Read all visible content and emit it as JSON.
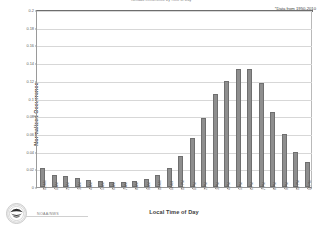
{
  "chart_data": {
    "type": "bar",
    "title": "Tornado Occurrence by Time of Day",
    "subtitle": "",
    "xlabel": "Local Time of Day",
    "ylabel": "Normalized Occurrence",
    "ylim": [
      0,
      0.2
    ],
    "ytick_labels": [
      "0.2",
      "0.18",
      "0.16",
      "0.14",
      "0.12",
      "0.1",
      "0.08",
      "0.06",
      "0.04",
      "0.02",
      "0"
    ],
    "ytick_values": [
      0.2,
      0.18,
      0.16,
      0.14,
      0.12,
      0.1,
      0.08,
      0.06,
      0.04,
      0.02,
      0
    ],
    "grid": true,
    "legend": "none",
    "annotation": "*Data from 1950-2010",
    "bar_color": "#8e8e8e",
    "bar_edge_color": "#6f6f6f",
    "categories": [
      "12 AM",
      "1 AM",
      "2 AM",
      "3 AM",
      "4 AM",
      "5 AM",
      "6 AM",
      "7 AM",
      "8 AM",
      "9 AM",
      "10 AM",
      "11 AM",
      "12 PM",
      "1 PM",
      "2 PM",
      "3 PM",
      "4 PM",
      "5 PM",
      "6 PM",
      "7 PM",
      "8 PM",
      "9 PM",
      "10 PM",
      "11 PM"
    ],
    "values": [
      0.022,
      0.014,
      0.012,
      0.01,
      0.008,
      0.007,
      0.006,
      0.006,
      0.007,
      0.009,
      0.014,
      0.022,
      0.035,
      0.055,
      0.078,
      0.105,
      0.12,
      0.133,
      0.133,
      0.118,
      0.085,
      0.06,
      0.04,
      0.028
    ]
  },
  "footer": {
    "agency_text": "NOAA/NWS",
    "seal_name": "noaa-seal"
  }
}
